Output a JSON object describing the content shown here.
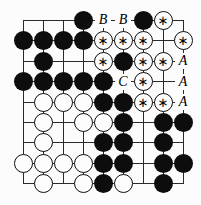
{
  "diagram": {
    "type": "go-board-problem-diagram",
    "board_size": 9,
    "star_mark": "∗",
    "colors": {
      "background": "#fcfcfc",
      "line": "#2a2a2a",
      "black_stone": "#0d0d0d",
      "white_stone": "#fdfdfd",
      "label_text": "#000000"
    },
    "grid": [
      [
        "",
        "",
        "",
        "black",
        "B",
        "B",
        "black",
        "white-star",
        ""
      ],
      [
        "black",
        "black",
        "black",
        "black",
        "white-star",
        "white-star",
        "white-star",
        "",
        "white-star"
      ],
      [
        "",
        "black",
        "",
        "",
        "white-star",
        "black",
        "white-star",
        "white-star",
        "A"
      ],
      [
        "black",
        "black",
        "black",
        "black",
        "black",
        "C",
        "white-star",
        "",
        "A"
      ],
      [
        "",
        "white",
        "white",
        "white",
        "black",
        "black",
        "white-star",
        "white-star",
        "A"
      ],
      [
        "",
        "white",
        "",
        "white",
        "white",
        "black",
        "",
        "black",
        "black"
      ],
      [
        "",
        "white",
        "",
        "",
        "black",
        "black",
        "",
        "black",
        ""
      ],
      [
        "white",
        "white",
        "white",
        "white",
        "black",
        "black",
        "",
        "black",
        "black"
      ],
      [
        "",
        "white",
        "",
        "white",
        "black",
        "white",
        "",
        "black",
        ""
      ]
    ]
  }
}
